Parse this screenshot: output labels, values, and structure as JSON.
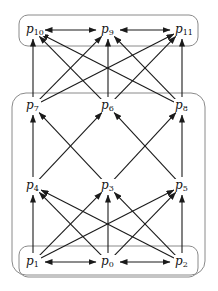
{
  "diagram": {
    "groups": [
      {
        "id": "top",
        "x": 19,
        "y": 15,
        "w": 179,
        "h": 31,
        "r": 9
      },
      {
        "id": "middle",
        "x": 12,
        "y": 93,
        "w": 193,
        "h": 182,
        "r": 14
      },
      {
        "id": "bottom",
        "x": 19,
        "y": 246,
        "w": 179,
        "h": 31,
        "r": 9
      }
    ],
    "nodes": [
      {
        "id": "p10",
        "base": "p",
        "sub": "10",
        "x": 33,
        "y": 30
      },
      {
        "id": "p9",
        "base": "p",
        "sub": "9",
        "x": 108,
        "y": 30
      },
      {
        "id": "p11",
        "base": "p",
        "sub": "11",
        "x": 182,
        "y": 30
      },
      {
        "id": "p7",
        "base": "p",
        "sub": "7",
        "x": 33,
        "y": 106
      },
      {
        "id": "p6",
        "base": "p",
        "sub": "6",
        "x": 108,
        "y": 106
      },
      {
        "id": "p8",
        "base": "p",
        "sub": "8",
        "x": 182,
        "y": 106
      },
      {
        "id": "p4",
        "base": "p",
        "sub": "4",
        "x": 33,
        "y": 186
      },
      {
        "id": "p3",
        "base": "p",
        "sub": "3",
        "x": 108,
        "y": 186
      },
      {
        "id": "p5",
        "base": "p",
        "sub": "5",
        "x": 182,
        "y": 186
      },
      {
        "id": "p1",
        "base": "p",
        "sub": "1",
        "x": 33,
        "y": 262
      },
      {
        "id": "p0",
        "base": "p",
        "sub": "0",
        "x": 108,
        "y": 262
      },
      {
        "id": "p2",
        "base": "p",
        "sub": "2",
        "x": 182,
        "y": 262
      }
    ],
    "edges": [
      {
        "from": "p10",
        "to": "p9",
        "bidirectional": true
      },
      {
        "from": "p9",
        "to": "p11",
        "bidirectional": true
      },
      {
        "from": "p7",
        "to": "p10"
      },
      {
        "from": "p7",
        "to": "p9"
      },
      {
        "from": "p7",
        "to": "p11"
      },
      {
        "from": "p6",
        "to": "p10"
      },
      {
        "from": "p6",
        "to": "p9"
      },
      {
        "from": "p6",
        "to": "p11"
      },
      {
        "from": "p8",
        "to": "p10"
      },
      {
        "from": "p8",
        "to": "p9"
      },
      {
        "from": "p8",
        "to": "p11"
      },
      {
        "from": "p4",
        "to": "p7"
      },
      {
        "from": "p4",
        "to": "p6"
      },
      {
        "from": "p3",
        "to": "p7"
      },
      {
        "from": "p3",
        "to": "p8"
      },
      {
        "from": "p5",
        "to": "p6"
      },
      {
        "from": "p5",
        "to": "p8"
      },
      {
        "from": "p1",
        "to": "p4"
      },
      {
        "from": "p1",
        "to": "p3"
      },
      {
        "from": "p1",
        "to": "p5"
      },
      {
        "from": "p0",
        "to": "p4"
      },
      {
        "from": "p0",
        "to": "p3"
      },
      {
        "from": "p0",
        "to": "p5"
      },
      {
        "from": "p2",
        "to": "p4"
      },
      {
        "from": "p2",
        "to": "p3"
      },
      {
        "from": "p2",
        "to": "p5"
      },
      {
        "from": "p1",
        "to": "p0",
        "bidirectional": true
      },
      {
        "from": "p0",
        "to": "p2",
        "bidirectional": true
      }
    ],
    "colors": {
      "stroke": "#1a1a1a",
      "group_stroke": "#8a8a8a"
    }
  }
}
